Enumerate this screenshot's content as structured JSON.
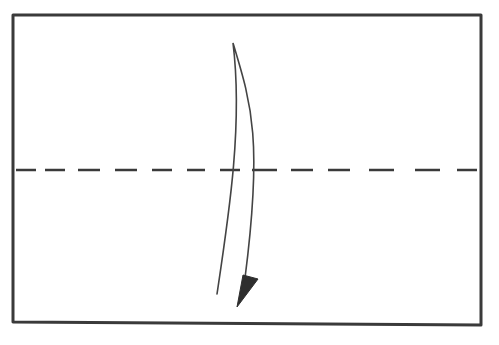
{
  "diagram": {
    "title": "Valley fold in half (fold top edge down to bottom edge)",
    "type": "origami-fold-step",
    "colors": {
      "background": "#ffffff",
      "stroke": "#3a3a3a",
      "arrow_fill": "#2e2e2e"
    },
    "paper": {
      "shape": "rectangle",
      "corners": {
        "top_left": [
          13,
          15
        ],
        "top_right": [
          481,
          15
        ],
        "bottom_right": [
          481,
          325
        ],
        "bottom_left": [
          13,
          322
        ]
      },
      "stroke_width": 3
    },
    "fold_line": {
      "style": "dashed",
      "kind": "valley-fold",
      "y": 170,
      "x_start": 16,
      "x_end": 478,
      "dashes": [
        [
          16,
          36
        ],
        [
          45,
          65
        ],
        [
          78,
          100
        ],
        [
          115,
          137
        ],
        [
          152,
          172
        ],
        [
          187,
          205
        ],
        [
          220,
          240
        ],
        [
          252,
          277
        ],
        [
          291,
          313
        ],
        [
          328,
          350
        ],
        [
          369,
          394
        ],
        [
          415,
          440
        ],
        [
          457,
          477
        ]
      ]
    },
    "arrow": {
      "kind": "fold-direction-arrow",
      "direction": "down",
      "start_tip": [
        233,
        43
      ],
      "inner_end": [
        245,
        278
      ],
      "outer_end": [
        217,
        294
      ],
      "head": [
        [
          243,
          275
        ],
        [
          258,
          279
        ],
        [
          237,
          307
        ]
      ]
    }
  }
}
